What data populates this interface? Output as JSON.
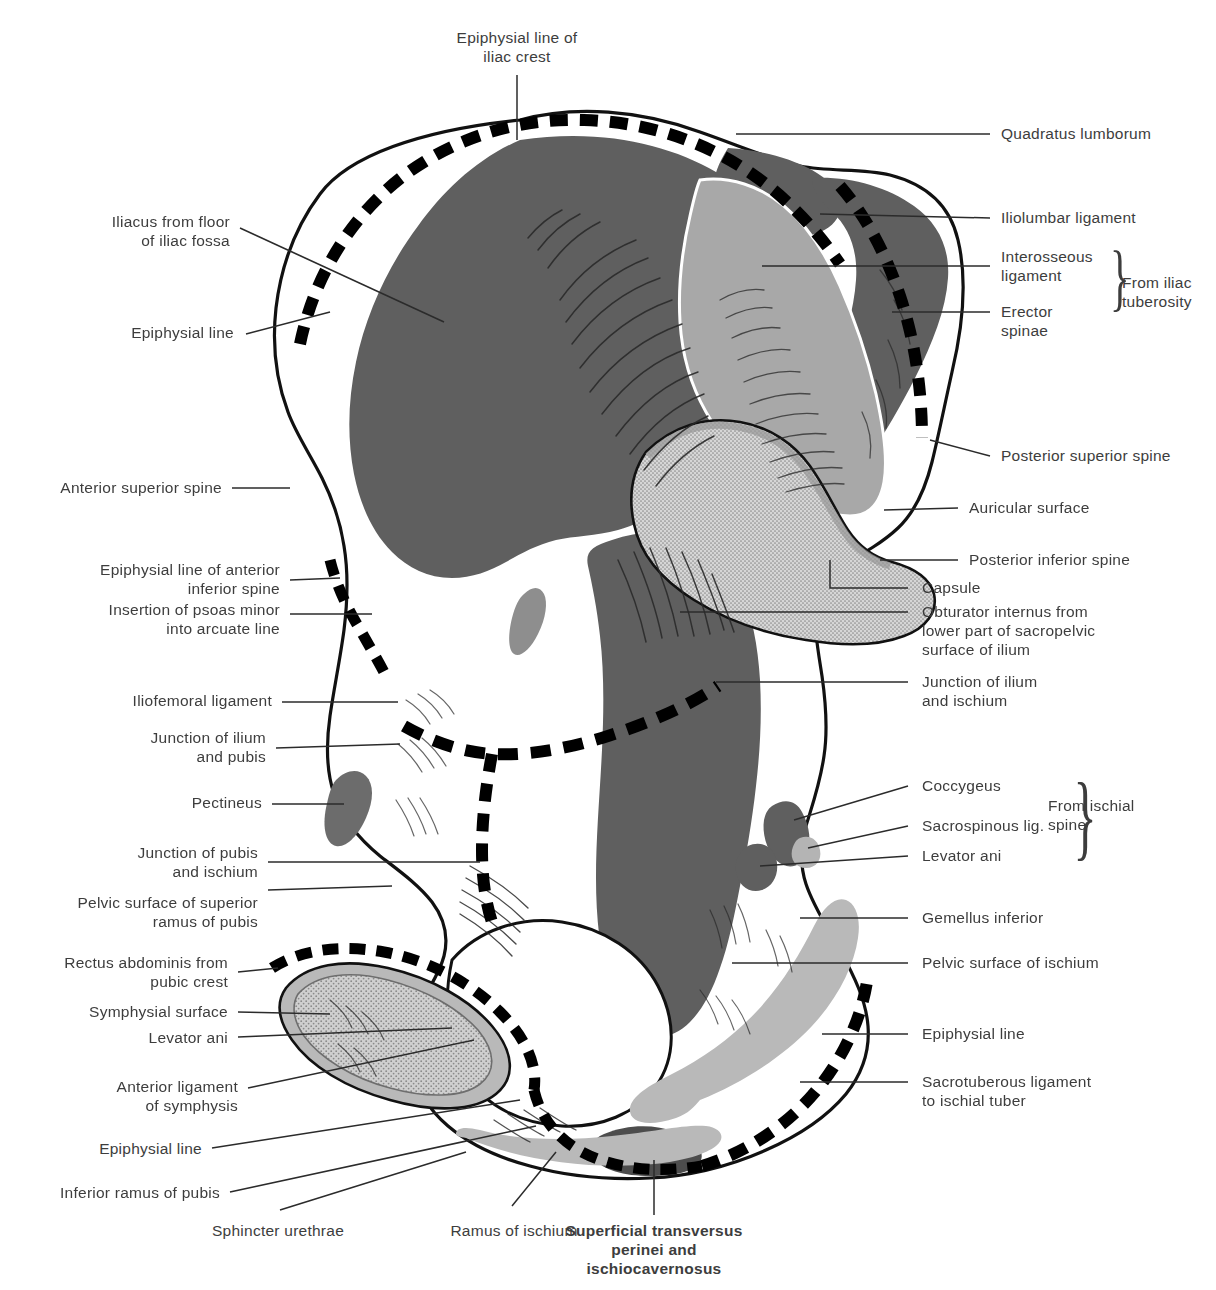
{
  "figure": {
    "colors": {
      "background": "#ffffff",
      "bone_outline": "#111111",
      "dark_attachment": "#5f5f5f",
      "mid_attachment": "#a8a8a8",
      "light_attachment": "#c9c9c9",
      "stipple_surface": "#bdbdbd",
      "epiphysial_dash": "#000000",
      "leader_line": "#2b2b2b",
      "label_text": "#3d3d3d"
    },
    "legend_note": "Dashed heavy black bands mark epiphysial lines; grey tones mark muscle / ligament attachment areas."
  },
  "labels": {
    "top": [
      {
        "id": "epiphysial-line-of-iliac-crest",
        "text": "Epiphysial line of\niliac crest"
      }
    ],
    "left": [
      {
        "id": "iliacus-from-floor-of-iliac-fossa",
        "text": "Iliacus from floor\nof iliac fossa"
      },
      {
        "id": "epiphysial-line-upper",
        "text": "Epiphysial line"
      },
      {
        "id": "anterior-superior-spine",
        "text": "Anterior superior spine"
      },
      {
        "id": "epiphysial-line-of-anterior-inferior-spine",
        "text": "Epiphysial line of anterior\ninferior spine"
      },
      {
        "id": "insertion-of-psoas-minor-into-arcuate-line",
        "text": "Insertion of psoas minor\ninto arcuate line"
      },
      {
        "id": "iliofemoral-ligament",
        "text": "Iliofemoral ligament"
      },
      {
        "id": "junction-of-ilium-and-pubis",
        "text": "Junction of ilium\nand pubis"
      },
      {
        "id": "pectineus",
        "text": "Pectineus"
      },
      {
        "id": "junction-of-pubis-and-ischium",
        "text": "Junction of pubis\nand ischium"
      },
      {
        "id": "pelvic-surface-of-superior-ramus-of-pubis",
        "text": "Pelvic surface of superior\nramus of pubis"
      },
      {
        "id": "rectus-abdominis-from-pubic-crest",
        "text": "Rectus abdominis from\npubic crest"
      },
      {
        "id": "symphysial-surface",
        "text": "Symphysial surface"
      },
      {
        "id": "levator-ani-left",
        "text": "Levator ani"
      },
      {
        "id": "anterior-ligament-of-symphysis",
        "text": "Anterior ligament\nof symphysis"
      },
      {
        "id": "epiphysial-line-lower-left",
        "text": "Epiphysial line"
      },
      {
        "id": "inferior-ramus-of-pubis",
        "text": "Inferior ramus of pubis"
      }
    ],
    "right": [
      {
        "id": "quadratus-lumborum",
        "text": "Quadratus lumborum"
      },
      {
        "id": "iliolumbar-ligament",
        "text": "Iliolumbar ligament"
      },
      {
        "id": "interosseous-ligament",
        "text": "Interosseous\nligament"
      },
      {
        "id": "erector-spinae",
        "text": "Erector\nspinae"
      },
      {
        "id": "from-iliac-tuberosity",
        "text": "From iliac\ntuberosity"
      },
      {
        "id": "posterior-superior-spine",
        "text": "Posterior superior spine"
      },
      {
        "id": "auricular-surface",
        "text": "Auricular surface"
      },
      {
        "id": "posterior-inferior-spine",
        "text": "Posterior inferior spine"
      },
      {
        "id": "capsule",
        "text": "Capsule"
      },
      {
        "id": "obturator-internus",
        "text": "Obturator internus from\nlower part of sacropelvic\nsurface of ilium"
      },
      {
        "id": "junction-of-ilium-and-ischium",
        "text": "Junction of ilium\nand ischium"
      },
      {
        "id": "coccygeus",
        "text": "Coccygeus"
      },
      {
        "id": "sacrospinous-ligament",
        "text": "Sacrospinous lig."
      },
      {
        "id": "levator-ani-right",
        "text": "Levator ani"
      },
      {
        "id": "from-ischial-spine",
        "text": "From ischial\nspine"
      },
      {
        "id": "gemellus-inferior",
        "text": "Gemellus inferior"
      },
      {
        "id": "pelvic-surface-of-ischium",
        "text": "Pelvic surface of ischium"
      },
      {
        "id": "epiphysial-line-lower-right",
        "text": "Epiphysial line"
      },
      {
        "id": "sacrotuberous-ligament",
        "text": "Sacrotuberous ligament\nto ischial tuber"
      }
    ],
    "bottom": [
      {
        "id": "sphincter-urethrae",
        "text": "Sphincter urethrae"
      },
      {
        "id": "ramus-of-ischium",
        "text": "Ramus of ischium"
      },
      {
        "id": "superficial-transversus-perinei",
        "text": "Superficial transversus\nperinei and\nischiocavernosus"
      }
    ]
  }
}
